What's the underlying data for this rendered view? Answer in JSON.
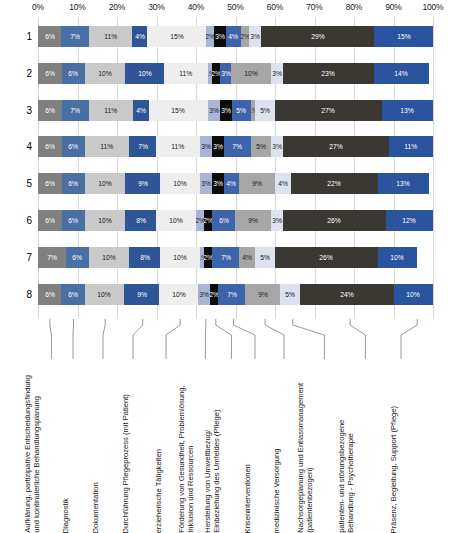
{
  "chart_data": {
    "type": "bar",
    "subtype": "stacked-horizontal-100-percent",
    "title": "",
    "xlabel": "",
    "ylabel": "",
    "xlim": [
      0,
      100
    ],
    "grid": true,
    "legend_position": "below-rotated-callouts",
    "x_ticks": [
      "0%",
      "10%",
      "20%",
      "30%",
      "40%",
      "50%",
      "60%",
      "70%",
      "80%",
      "90%",
      "100%"
    ],
    "x_tick_values": [
      0,
      10,
      20,
      30,
      40,
      50,
      60,
      70,
      80,
      90,
      100
    ],
    "categories": [
      "1",
      "2",
      "3",
      "4",
      "5",
      "6",
      "7",
      "8"
    ],
    "series": [
      {
        "name": "Aufklärung, partizipative Entscheidungsfindung und kontinuierliche Behandlungsplanung",
        "color": "#808080",
        "label_color": "#ffffff",
        "values": [
          6,
          6,
          6,
          6,
          6,
          6,
          7,
          6
        ],
        "labels": [
          "6%",
          "6%",
          "6%",
          "6%",
          "6%",
          "6%",
          "7%",
          "6%"
        ]
      },
      {
        "name": "Diagnostik",
        "color": "#4a6fa5",
        "label_color": "#ffffff",
        "values": [
          7,
          6,
          7,
          6,
          6,
          6,
          6,
          6
        ],
        "labels": [
          "7%",
          "6%",
          "7%",
          "6%",
          "6%",
          "6%",
          "6%",
          "6%"
        ]
      },
      {
        "name": "Dokumentation",
        "color": "#c9c9c9",
        "label_color": "#1a1a1a",
        "values": [
          11,
          10,
          11,
          11,
          10,
          10,
          10,
          10
        ],
        "labels": [
          "11%",
          "10%",
          "11%",
          "11%",
          "10%",
          "10%",
          "10%",
          "10%"
        ]
      },
      {
        "name": "Durchführung Pflegeprozess (mit Patient)",
        "color": "#2f5597",
        "label_color": "#ffffff",
        "values": [
          4,
          10,
          4,
          7,
          9,
          8,
          8,
          9
        ],
        "labels": [
          "4%",
          "10%",
          "4%",
          "7%",
          "9%",
          "8%",
          "8%",
          "9%"
        ]
      },
      {
        "name": "erzieherische Tätigkeiten",
        "color": "#eeeeee",
        "label_color": "#1a1a1a",
        "values": [
          15,
          11,
          15,
          11,
          10,
          10,
          10,
          10
        ],
        "labels": [
          "15%",
          "11%",
          "15%",
          "11%",
          "10%",
          "10%",
          "10%",
          "10%"
        ]
      },
      {
        "name": "Förderung von Gesundheit, Problemlösung, Inklusion und Ressourcen",
        "color": "#aab4d4",
        "label_color": "#1a1a1a",
        "values": [
          2,
          1,
          3,
          3,
          3,
          2,
          1,
          3
        ],
        "labels": [
          "2%",
          "1%",
          "3%",
          "3%",
          "3%",
          "2%",
          "1%",
          "3%"
        ]
      },
      {
        "name": "Herstellung von Umweltbezug/ Einbeziehung des Umfeldes (Pflege)",
        "color": "#0d0d0d",
        "label_color": "#ffffff",
        "values": [
          3,
          2,
          3,
          3,
          3,
          2,
          2,
          2
        ],
        "labels": [
          "3%",
          "2%",
          "3%",
          "3%",
          "3%",
          "2%",
          "2%",
          "2%"
        ]
      },
      {
        "name": "Kriseninterventionen",
        "color": "#3d63ab",
        "label_color": "#ffffff",
        "values": [
          4,
          3,
          5,
          7,
          4,
          6,
          7,
          7
        ],
        "labels": [
          "4%",
          "3%",
          "5%",
          "7%",
          "4%",
          "6%",
          "7%",
          "7%"
        ]
      },
      {
        "name": "medizinische Versorgung",
        "color": "#a6a6a6",
        "label_color": "#1a1a1a",
        "values": [
          2,
          10,
          1,
          5,
          9,
          9,
          4,
          9
        ],
        "labels": [
          "2%",
          "10%",
          "1%",
          "5%",
          "9%",
          "9%",
          "4%",
          "9%"
        ]
      },
      {
        "name": "Nachsorgeplanung und Entlassmanagement (patientenbezogen)",
        "color": "#dde2ef",
        "label_color": "#1a1a1a",
        "values": [
          3,
          3,
          5,
          3,
          4,
          3,
          5,
          5
        ],
        "labels": [
          "3%",
          "3%",
          "5%",
          "3%",
          "4%",
          "3%",
          "5%",
          "5%"
        ]
      },
      {
        "name": "patienten- und störungsbezogene Behandlung - Psychotherapie",
        "color": "#3b3733",
        "label_color": "#ffffff",
        "values": [
          29,
          23,
          27,
          27,
          22,
          26,
          26,
          24
        ],
        "labels": [
          "29%",
          "23%",
          "27%",
          "27%",
          "22%",
          "26%",
          "26%",
          "24%"
        ]
      },
      {
        "name": "Präsenz, Begleitung, Support (Pflege)",
        "color": "#2a549e",
        "label_color": "#ffffff",
        "values": [
          15,
          14,
          13,
          11,
          13,
          12,
          10,
          10
        ],
        "labels": [
          "15%",
          "14%",
          "13%",
          "11%",
          "13%",
          "12%",
          "10%",
          "10%"
        ]
      }
    ],
    "category_label_lines": [
      [
        "Aufklärung, partizipative Entscheidungsfindung",
        "und kontinuierliche Behandlungsplanung"
      ],
      [
        "Diagnostik"
      ],
      [
        "Dokumentation"
      ],
      [
        "Durchführung Pflegeprozess (mit Patient)"
      ],
      [
        "erzieherische Tätigkeiten"
      ],
      [
        "Förderung von Gesundheit, Problemlösung,",
        "Inklusion und Ressourcen"
      ],
      [
        "Herstellung von Umweltbezug/",
        "Einbeziehung des Umfeldes (Pflege)"
      ],
      [
        "Kriseninterventionen"
      ],
      [
        "medizinische Versorgung"
      ],
      [
        "Nachsorgeplanung und Entlassmanagement",
        "(patientenbezogen)"
      ],
      [
        "patienten- und störungsbezogene",
        "Behandlung - Psychotherapie"
      ],
      [
        "Präsenz, Begleitung, Support (Pflege)"
      ]
    ]
  }
}
